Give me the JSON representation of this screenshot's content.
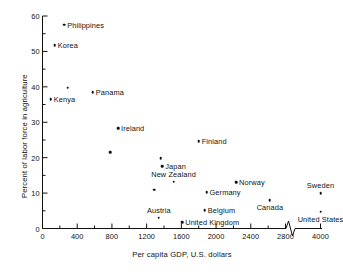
{
  "chart_data": {
    "type": "scatter",
    "title": "",
    "xlabel": "Per capita GDP, U.S. dollars",
    "ylabel": "Percent of labor force in agriculture",
    "xlim": [
      0,
      4000
    ],
    "ylim": [
      0,
      60
    ],
    "grid": false,
    "legend": "none",
    "axis_break": {
      "present": true,
      "after": 2800,
      "before": 4000
    },
    "xticks": [
      0,
      400,
      800,
      1200,
      1600,
      2000,
      2400,
      2800,
      4000
    ],
    "xtick_labels": [
      "0",
      "400",
      "800",
      "1200",
      "1600",
      "2000",
      "2400",
      "2800",
      "4000"
    ],
    "xminor_step": 200,
    "yticks": [
      0,
      10,
      20,
      30,
      40,
      50,
      60
    ],
    "ytick_labels": [
      "0",
      "10",
      "20",
      "30",
      "40",
      "50",
      "60"
    ],
    "yminor_step": 5,
    "points": [
      {
        "label": "Philippines",
        "x": 250,
        "y": 57.5,
        "label_pos": "right"
      },
      {
        "label": "Korea",
        "x": 140,
        "y": 51.8,
        "label_pos": "right"
      },
      {
        "label": "",
        "x": 290,
        "y": 39.7,
        "label_pos": "none"
      },
      {
        "label": "Panama",
        "x": 580,
        "y": 38.5,
        "label_pos": "right"
      },
      {
        "label": "Kenya",
        "x": 95,
        "y": 36.5,
        "label_pos": "right"
      },
      {
        "label": "Ireland",
        "x": 870,
        "y": 28.3,
        "label_pos": "right"
      },
      {
        "label": "",
        "x": 780,
        "y": 21.6,
        "label_pos": "none"
      },
      {
        "label": "Finland",
        "x": 1800,
        "y": 24.6,
        "label_pos": "right"
      },
      {
        "label": "",
        "x": 1360,
        "y": 19.9,
        "label_pos": "none"
      },
      {
        "label": "Japan",
        "x": 1380,
        "y": 17.6,
        "label_pos": "right"
      },
      {
        "label": "New Zealand",
        "x": 1510,
        "y": 13.2,
        "label_pos": "above"
      },
      {
        "label": "Norway",
        "x": 2230,
        "y": 13.0,
        "label_pos": "right"
      },
      {
        "label": "",
        "x": 1290,
        "y": 11.0,
        "label_pos": "none"
      },
      {
        "label": "Germany",
        "x": 1890,
        "y": 10.2,
        "label_pos": "right"
      },
      {
        "label": "Sweden",
        "x": 2870,
        "y": 10.0,
        "label_pos": "above"
      },
      {
        "label": "Canada",
        "x": 2620,
        "y": 8.0,
        "label_pos": "below"
      },
      {
        "label": "Belgium",
        "x": 1870,
        "y": 5.1,
        "label_pos": "right"
      },
      {
        "label": "United States",
        "x": 4000,
        "y": 4.7,
        "label_pos": "below"
      },
      {
        "label": "Austria",
        "x": 1340,
        "y": 3.0,
        "label_pos": "above"
      },
      {
        "label": "United Kingdom",
        "x": 1610,
        "y": 1.8,
        "label_pos": "right"
      }
    ]
  },
  "axis": {
    "x_title": "Per capita GDP, U.S. dollars",
    "y_title": "Percent of labor force in agriculture"
  }
}
